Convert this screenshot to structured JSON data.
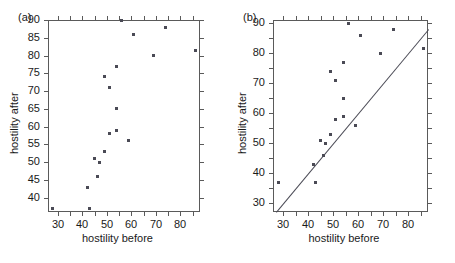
{
  "figure": {
    "panels": [
      {
        "label": "(a)",
        "xlabel": "hostility before",
        "ylabel": "hostility after",
        "xlim": [
          26,
          88
        ],
        "ylim": [
          36,
          90
        ],
        "xticks": [
          30,
          40,
          50,
          60,
          70,
          80
        ],
        "yticks": [
          40,
          45,
          50,
          55,
          60,
          65,
          70,
          75,
          80,
          85,
          90
        ],
        "minor_ytick_step": 5,
        "identity_line": false
      },
      {
        "label": "(b)",
        "xlabel": "hostility before",
        "ylabel": "hostility after",
        "xlim": [
          26,
          88
        ],
        "ylim": [
          27,
          91
        ],
        "xticks": [
          30,
          40,
          50,
          60,
          70,
          80
        ],
        "yticks": [
          30,
          40,
          50,
          60,
          70,
          80,
          90
        ],
        "minor_ytick_step": 5,
        "identity_line": true
      }
    ]
  },
  "chart_data": {
    "type": "scatter",
    "title": "",
    "xlabel": "hostility before",
    "ylabel": "hostility after",
    "x": [
      28,
      43,
      42,
      46,
      45,
      47,
      49,
      49,
      51,
      51,
      54,
      54,
      54,
      56,
      59,
      61,
      69,
      74,
      86
    ],
    "y": [
      37,
      37,
      43,
      46,
      51,
      50,
      53,
      74,
      58,
      71,
      59,
      65,
      77,
      90,
      56,
      86,
      80,
      88,
      81.5
    ],
    "series": [
      {
        "name": "hostility before vs after",
        "points": [
          [
            28,
            37
          ],
          [
            43,
            37
          ],
          [
            42,
            43
          ],
          [
            46,
            46
          ],
          [
            45,
            51
          ],
          [
            47,
            50
          ],
          [
            49,
            53
          ],
          [
            49,
            74
          ],
          [
            51,
            58
          ],
          [
            51,
            71
          ],
          [
            54,
            59
          ],
          [
            54,
            65
          ],
          [
            54,
            77
          ],
          [
            56,
            90
          ],
          [
            59,
            56
          ],
          [
            61,
            86
          ],
          [
            69,
            80
          ],
          [
            74,
            88
          ],
          [
            86,
            81.5
          ]
        ]
      }
    ],
    "annotations": [
      "panel (b) includes the y = x identity line"
    ],
    "grid": false,
    "legend": null,
    "marker": "square",
    "marker_color": "#4a4a55"
  }
}
